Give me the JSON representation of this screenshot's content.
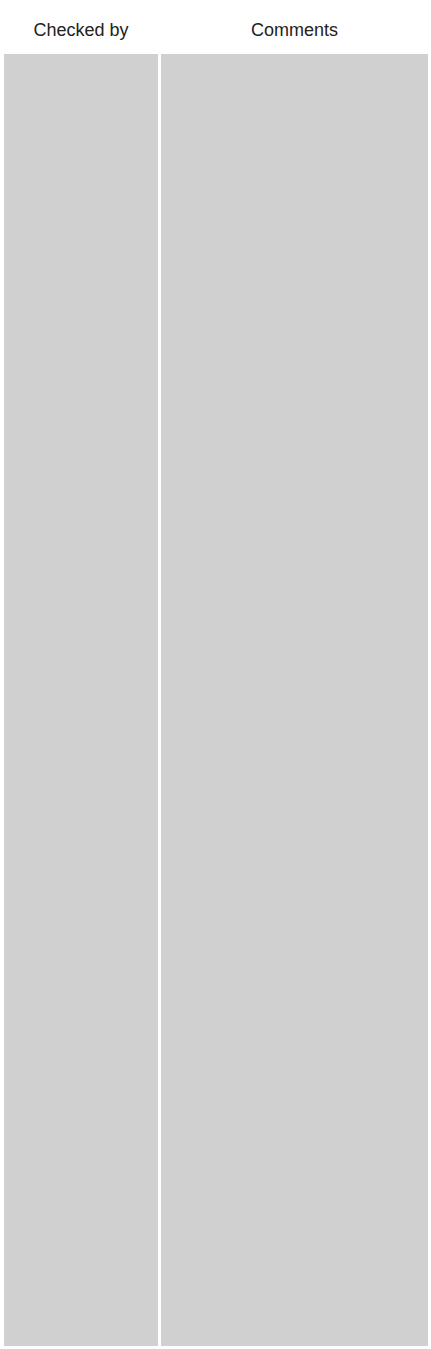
{
  "table": {
    "columns": [
      {
        "label": "Checked by",
        "value": ""
      },
      {
        "label": "Comments",
        "value": ""
      }
    ],
    "fill_color": "#d0d0d0"
  }
}
